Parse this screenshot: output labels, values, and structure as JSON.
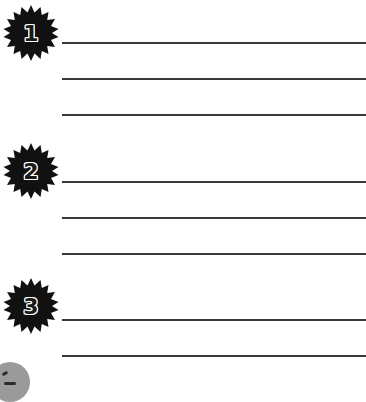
{
  "worksheet": {
    "sections": [
      {
        "number": "1",
        "line_count": 3
      },
      {
        "number": "2",
        "line_count": 3
      },
      {
        "number": "3",
        "line_count": 2
      }
    ],
    "colors": {
      "badge": "#111111",
      "line": "#3a3a3a",
      "background": "#ffffff"
    }
  }
}
